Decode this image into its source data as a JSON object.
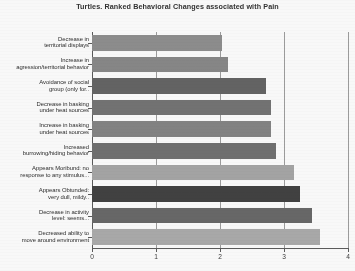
{
  "chart_data": {
    "type": "bar",
    "orientation": "horizontal",
    "title": "Turtles. Ranked Behavioral Changes associated with Pain",
    "xlabel": "",
    "ylabel": "",
    "xlim": [
      0,
      4
    ],
    "xticks": [
      "0",
      "1",
      "2",
      "3",
      "4"
    ],
    "grid": true,
    "legend": "none",
    "categories": [
      "Decrease in\nterritorial displays",
      "Increase in\nagression/territorial behavior",
      "Avoidance of social\ngroup (only for..",
      "Decrease in basking\nunder heat sources",
      "Increase in basking\nunder heat sources",
      "Increased\nburrowing/hiding behavior",
      "Appears Moribund: no\nresponse to any stimulus...",
      "Appears Obtunded:\nvery dull, mildy..",
      "Decrease in activity\nlevel: seems...",
      "Decreased ability to\nmove around environment"
    ],
    "values": [
      2.03,
      2.13,
      2.72,
      2.8,
      2.8,
      2.88,
      3.16,
      3.25,
      3.44,
      3.56
    ],
    "bar_colors": [
      "#8a8a8a",
      "#848484",
      "#5e5e5e",
      "#6e6e6e",
      "#7f7f7f",
      "#6b6b6b",
      "#a3a3a3",
      "#3a3a3a",
      "#636363",
      "#a8a8a8"
    ]
  }
}
